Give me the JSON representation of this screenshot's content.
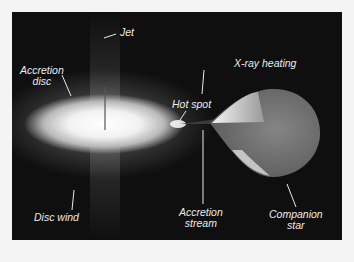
{
  "diagram": {
    "type": "illustration",
    "colors": {
      "background": "#0f0f0f",
      "page": "#f4f4f4",
      "label_text": "#ececec",
      "disc_core": "#ffffff",
      "star_body": "#7a7a7a"
    },
    "labels": {
      "jet": "Jet",
      "accretion_disc_line1": "Accretion",
      "accretion_disc_line2": "disc",
      "xray_heating": "X-ray heating",
      "hot_spot": "Hot spot",
      "accretion_stream_line1": "Accretion",
      "accretion_stream_line2": "stream",
      "companion_star_line1": "Companion",
      "companion_star_line2": "star",
      "disc_wind": "Disc wind"
    }
  }
}
